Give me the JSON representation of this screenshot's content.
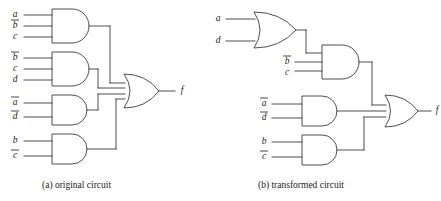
{
  "figure": {
    "type": "logic-circuit-diagram",
    "width": 441,
    "height": 201,
    "line_color": "#3a3a3a",
    "text_color": "#1b1b1b",
    "background": "#ffffff"
  },
  "captions": {
    "a": "(a) original circuit",
    "b": "(b) transformed circuit"
  },
  "circuit_a": {
    "name": "original circuit",
    "output_label": "f",
    "expression": "a b' c + b' c d + a' d' + b c'",
    "gates": [
      {
        "id": "a-and1",
        "type": "AND",
        "inputs": [
          {
            "label": "a",
            "overbar": false
          },
          {
            "label": "b",
            "overbar": true
          },
          {
            "label": "c",
            "overbar": false
          }
        ]
      },
      {
        "id": "a-and2",
        "type": "AND",
        "inputs": [
          {
            "label": "b",
            "overbar": true
          },
          {
            "label": "c",
            "overbar": false
          },
          {
            "label": "d",
            "overbar": false
          }
        ]
      },
      {
        "id": "a-and3",
        "type": "AND",
        "inputs": [
          {
            "label": "a",
            "overbar": true
          },
          {
            "label": "d",
            "overbar": true
          }
        ]
      },
      {
        "id": "a-and4",
        "type": "AND",
        "inputs": [
          {
            "label": "b",
            "overbar": false
          },
          {
            "label": "c",
            "overbar": true
          }
        ]
      },
      {
        "id": "a-or1",
        "type": "OR",
        "input_count": 4,
        "output": "f"
      }
    ]
  },
  "circuit_b": {
    "name": "transformed circuit",
    "output_label": "f",
    "expression": "(a + d) b' c + a' d' + b c'",
    "gates": [
      {
        "id": "b-or1",
        "type": "OR",
        "inputs": [
          {
            "label": "a",
            "overbar": false
          },
          {
            "label": "d",
            "overbar": false
          }
        ]
      },
      {
        "id": "b-and1",
        "type": "AND",
        "input_count": 3,
        "inputs": [
          {
            "label": "b",
            "overbar": true
          },
          {
            "label": "c",
            "overbar": false
          }
        ],
        "fed_by": "b-or1"
      },
      {
        "id": "b-and2",
        "type": "AND",
        "inputs": [
          {
            "label": "a",
            "overbar": true
          },
          {
            "label": "d",
            "overbar": true
          }
        ]
      },
      {
        "id": "b-and3",
        "type": "AND",
        "inputs": [
          {
            "label": "b",
            "overbar": false
          },
          {
            "label": "c",
            "overbar": true
          }
        ]
      },
      {
        "id": "b-or2",
        "type": "OR",
        "input_count": 3,
        "output": "f"
      }
    ]
  }
}
